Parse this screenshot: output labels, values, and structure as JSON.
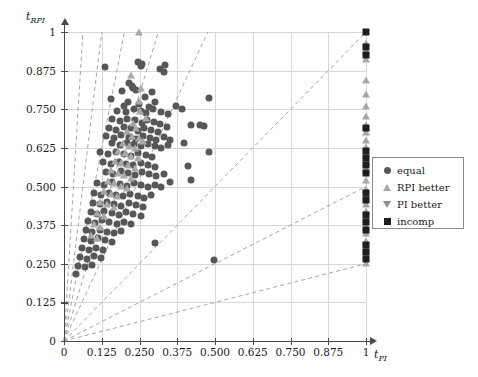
{
  "chart_data": {
    "type": "scatter",
    "title": "",
    "xlabel": "t_PI",
    "ylabel": "t_RPI",
    "xlabel_base": "t",
    "xlabel_sub": "PI",
    "ylabel_base": "t",
    "ylabel_sub": "RPI",
    "xlim": [
      0,
      1
    ],
    "ylim": [
      0,
      1
    ],
    "grid": true,
    "legend_position": "right-middle",
    "xticks": [
      0,
      0.125,
      0.25,
      0.375,
      0.5,
      0.625,
      0.75,
      0.875,
      1
    ],
    "xticklabels": [
      "0",
      "0.125",
      "0.250",
      "0.375",
      "0.500",
      "0.625",
      "0.750",
      "0.875",
      "1"
    ],
    "yticks": [
      0,
      0.125,
      0.25,
      0.375,
      0.5,
      0.625,
      0.75,
      0.875,
      1
    ],
    "yticklabels": [
      "0",
      "0.125",
      "0.250",
      "0.375",
      "0.500",
      "0.625",
      "0.750",
      "0.875",
      "1"
    ],
    "reference_lines": {
      "style": "dashed",
      "color": "#9a9a9a",
      "description": "rays from origin",
      "slopes": [
        16.0,
        8.0,
        5.0,
        3.2,
        2.1,
        1.0,
        0.5,
        0.25
      ]
    },
    "series": [
      {
        "name": "equal",
        "marker": "circle",
        "color": "#575757",
        "points": [
          [
            0.137,
            0.886
          ],
          [
            0.255,
            0.889
          ],
          [
            0.336,
            0.893
          ],
          [
            0.246,
            0.902
          ],
          [
            0.258,
            0.898
          ],
          [
            0.318,
            0.879
          ],
          [
            0.33,
            0.87
          ],
          [
            0.215,
            0.835
          ],
          [
            0.225,
            0.826
          ],
          [
            0.23,
            0.818
          ],
          [
            0.192,
            0.808
          ],
          [
            0.24,
            0.812
          ],
          [
            0.29,
            0.806
          ],
          [
            0.155,
            0.782
          ],
          [
            0.213,
            0.772
          ],
          [
            0.268,
            0.79
          ],
          [
            0.2,
            0.762
          ],
          [
            0.248,
            0.766
          ],
          [
            0.282,
            0.758
          ],
          [
            0.3,
            0.772
          ],
          [
            0.37,
            0.76
          ],
          [
            0.175,
            0.745
          ],
          [
            0.205,
            0.742
          ],
          [
            0.232,
            0.75
          ],
          [
            0.255,
            0.744
          ],
          [
            0.272,
            0.738
          ],
          [
            0.296,
            0.75
          ],
          [
            0.32,
            0.742
          ],
          [
            0.345,
            0.735
          ],
          [
            0.48,
            0.786
          ],
          [
            0.16,
            0.718
          ],
          [
            0.186,
            0.712
          ],
          [
            0.21,
            0.72
          ],
          [
            0.236,
            0.714
          ],
          [
            0.258,
            0.706
          ],
          [
            0.276,
            0.716
          ],
          [
            0.298,
            0.71
          ],
          [
            0.318,
            0.702
          ],
          [
            0.392,
            0.752
          ],
          [
            0.42,
            0.7
          ],
          [
            0.148,
            0.69
          ],
          [
            0.172,
            0.684
          ],
          [
            0.198,
            0.694
          ],
          [
            0.222,
            0.688
          ],
          [
            0.244,
            0.68
          ],
          [
            0.266,
            0.69
          ],
          [
            0.288,
            0.682
          ],
          [
            0.31,
            0.676
          ],
          [
            0.34,
            0.692
          ],
          [
            0.45,
            0.7
          ],
          [
            0.462,
            0.696
          ],
          [
            0.14,
            0.664
          ],
          [
            0.165,
            0.658
          ],
          [
            0.19,
            0.666
          ],
          [
            0.215,
            0.66
          ],
          [
            0.24,
            0.654
          ],
          [
            0.262,
            0.662
          ],
          [
            0.284,
            0.656
          ],
          [
            0.306,
            0.65
          ],
          [
            0.33,
            0.66
          ],
          [
            0.352,
            0.652
          ],
          [
            0.16,
            0.64
          ],
          [
            0.185,
            0.634
          ],
          [
            0.208,
            0.642
          ],
          [
            0.232,
            0.636
          ],
          [
            0.256,
            0.63
          ],
          [
            0.278,
            0.638
          ],
          [
            0.3,
            0.632
          ],
          [
            0.322,
            0.626
          ],
          [
            0.345,
            0.634
          ],
          [
            0.118,
            0.612
          ],
          [
            0.145,
            0.604
          ],
          [
            0.172,
            0.612
          ],
          [
            0.198,
            0.606
          ],
          [
            0.222,
            0.6
          ],
          [
            0.246,
            0.608
          ],
          [
            0.27,
            0.602
          ],
          [
            0.292,
            0.596
          ],
          [
            0.398,
            0.642
          ],
          [
            0.48,
            0.612
          ],
          [
            0.128,
            0.578
          ],
          [
            0.155,
            0.572
          ],
          [
            0.182,
            0.58
          ],
          [
            0.206,
            0.574
          ],
          [
            0.23,
            0.568
          ],
          [
            0.254,
            0.576
          ],
          [
            0.278,
            0.57
          ],
          [
            0.3,
            0.564
          ],
          [
            0.412,
            0.566
          ],
          [
            0.138,
            0.548
          ],
          [
            0.162,
            0.542
          ],
          [
            0.188,
            0.55
          ],
          [
            0.212,
            0.544
          ],
          [
            0.236,
            0.538
          ],
          [
            0.258,
            0.546
          ],
          [
            0.282,
            0.54
          ],
          [
            0.305,
            0.534
          ],
          [
            0.33,
            0.542
          ],
          [
            0.42,
            0.52
          ],
          [
            0.108,
            0.512
          ],
          [
            0.132,
            0.506
          ],
          [
            0.158,
            0.514
          ],
          [
            0.184,
            0.508
          ],
          [
            0.208,
            0.502
          ],
          [
            0.232,
            0.51
          ],
          [
            0.256,
            0.504
          ],
          [
            0.278,
            0.498
          ],
          [
            0.3,
            0.506
          ],
          [
            0.322,
            0.5
          ],
          [
            0.35,
            0.514
          ],
          [
            0.1,
            0.478
          ],
          [
            0.124,
            0.472
          ],
          [
            0.148,
            0.48
          ],
          [
            0.172,
            0.474
          ],
          [
            0.196,
            0.468
          ],
          [
            0.22,
            0.476
          ],
          [
            0.244,
            0.47
          ],
          [
            0.266,
            0.464
          ],
          [
            0.288,
            0.472
          ],
          [
            0.095,
            0.448
          ],
          [
            0.118,
            0.442
          ],
          [
            0.142,
            0.45
          ],
          [
            0.166,
            0.444
          ],
          [
            0.19,
            0.438
          ],
          [
            0.214,
            0.446
          ],
          [
            0.238,
            0.44
          ],
          [
            0.262,
            0.434
          ],
          [
            0.088,
            0.418
          ],
          [
            0.11,
            0.412
          ],
          [
            0.134,
            0.42
          ],
          [
            0.158,
            0.414
          ],
          [
            0.182,
            0.408
          ],
          [
            0.206,
            0.416
          ],
          [
            0.23,
            0.41
          ],
          [
            0.254,
            0.404
          ],
          [
            0.08,
            0.388
          ],
          [
            0.102,
            0.382
          ],
          [
            0.126,
            0.39
          ],
          [
            0.15,
            0.384
          ],
          [
            0.174,
            0.378
          ],
          [
            0.198,
            0.386
          ],
          [
            0.222,
            0.38
          ],
          [
            0.072,
            0.358
          ],
          [
            0.094,
            0.352
          ],
          [
            0.118,
            0.36
          ],
          [
            0.142,
            0.354
          ],
          [
            0.166,
            0.348
          ],
          [
            0.19,
            0.356
          ],
          [
            0.065,
            0.33
          ],
          [
            0.088,
            0.324
          ],
          [
            0.112,
            0.332
          ],
          [
            0.136,
            0.326
          ],
          [
            0.16,
            0.32
          ],
          [
            0.3,
            0.318
          ],
          [
            0.058,
            0.3
          ],
          [
            0.082,
            0.294
          ],
          [
            0.106,
            0.302
          ],
          [
            0.13,
            0.296
          ],
          [
            0.052,
            0.272
          ],
          [
            0.076,
            0.266
          ],
          [
            0.1,
            0.274
          ],
          [
            0.124,
            0.268
          ],
          [
            0.496,
            0.262
          ],
          [
            0.046,
            0.244
          ],
          [
            0.07,
            0.238
          ],
          [
            0.094,
            0.246
          ],
          [
            0.04,
            0.218
          ]
        ]
      },
      {
        "name": "RPI better",
        "marker": "triangle-up",
        "color": "#a8a8a8",
        "points": [
          [
            0.247,
            1.0
          ],
          [
            0.222,
            0.862
          ],
          [
            0.255,
            0.82
          ],
          [
            0.248,
            0.778
          ],
          [
            0.252,
            0.744
          ],
          [
            0.27,
            0.722
          ],
          [
            0.228,
            0.706
          ],
          [
            0.24,
            0.69
          ],
          [
            0.21,
            0.678
          ],
          [
            0.225,
            0.664
          ],
          [
            0.248,
            0.656
          ],
          [
            0.26,
            0.648
          ],
          [
            0.196,
            0.64
          ],
          [
            0.215,
            0.632
          ],
          [
            0.235,
            0.624
          ],
          [
            0.18,
            0.616
          ],
          [
            0.202,
            0.608
          ],
          [
            0.222,
            0.6
          ],
          [
            0.244,
            0.592
          ],
          [
            0.168,
            0.584
          ],
          [
            0.19,
            0.576
          ],
          [
            0.212,
            0.568
          ],
          [
            0.234,
            0.56
          ],
          [
            0.156,
            0.552
          ],
          [
            0.178,
            0.544
          ],
          [
            0.2,
            0.536
          ],
          [
            0.222,
            0.528
          ],
          [
            0.145,
            0.518
          ],
          [
            0.166,
            0.51
          ],
          [
            0.188,
            0.502
          ],
          [
            0.21,
            0.494
          ],
          [
            0.134,
            0.484
          ],
          [
            0.155,
            0.476
          ],
          [
            0.176,
            0.468
          ],
          [
            0.12,
            0.45
          ],
          [
            0.142,
            0.442
          ],
          [
            0.164,
            0.434
          ],
          [
            0.11,
            0.414
          ],
          [
            0.132,
            0.406
          ],
          [
            0.098,
            0.378
          ],
          [
            0.12,
            0.37
          ],
          [
            0.088,
            0.342
          ],
          [
            0.11,
            0.334
          ],
          [
            1.0,
            0.965
          ],
          [
            1.0,
            0.94
          ],
          [
            1.0,
            0.912
          ],
          [
            1.0,
            0.845
          ],
          [
            1.0,
            0.8
          ],
          [
            1.0,
            0.76
          ],
          [
            1.0,
            0.728
          ],
          [
            1.0,
            0.7
          ],
          [
            1.0,
            0.676
          ],
          [
            1.0,
            0.652
          ],
          [
            1.0,
            0.628
          ],
          [
            1.0,
            0.604
          ],
          [
            1.0,
            0.58
          ],
          [
            1.0,
            0.556
          ],
          [
            1.0,
            0.52
          ],
          [
            1.0,
            0.492
          ],
          [
            1.0,
            0.468
          ],
          [
            1.0,
            0.444
          ],
          [
            1.0,
            0.42
          ],
          [
            1.0,
            0.396
          ],
          [
            1.0,
            0.372
          ],
          [
            1.0,
            0.348
          ],
          [
            1.0,
            0.324
          ],
          [
            1.0,
            0.3
          ],
          [
            1.0,
            0.276
          ],
          [
            1.0,
            0.252
          ]
        ]
      },
      {
        "name": "PI better",
        "marker": "triangle-down",
        "color": "#8e8e8e",
        "points": []
      },
      {
        "name": "incomp",
        "marker": "square",
        "color": "#1f1f1f",
        "points": [
          [
            1.0,
            1.0
          ],
          [
            1.0,
            0.952
          ],
          [
            1.0,
            0.926
          ],
          [
            1.0,
            0.688
          ],
          [
            1.0,
            0.616
          ],
          [
            1.0,
            0.592
          ],
          [
            1.0,
            0.568
          ],
          [
            1.0,
            0.544
          ],
          [
            1.0,
            0.48
          ],
          [
            1.0,
            0.456
          ],
          [
            1.0,
            0.408
          ],
          [
            1.0,
            0.384
          ],
          [
            1.0,
            0.36
          ],
          [
            1.0,
            0.312
          ],
          [
            1.0,
            0.288
          ],
          [
            1.0,
            0.264
          ]
        ]
      }
    ]
  },
  "legend": {
    "entries": [
      {
        "label": "equal",
        "marker": "circle",
        "name": "legend-item-equal"
      },
      {
        "label": "RPI better",
        "marker": "triangle-up",
        "name": "legend-item-rpi-better"
      },
      {
        "label": "PI better",
        "marker": "triangle-down",
        "name": "legend-item-pi-better"
      },
      {
        "label": "incomp",
        "marker": "square",
        "name": "legend-item-incomp"
      }
    ]
  },
  "colors": {
    "equal": "#575757",
    "rpi_better": "#a8a8a8",
    "pi_better": "#8e8e8e",
    "incomp": "#1f1f1f",
    "grid": "#d8d8d8",
    "axis": "#4a4a4a",
    "dashed": "#9a9a9a",
    "background": "#ffffff"
  }
}
